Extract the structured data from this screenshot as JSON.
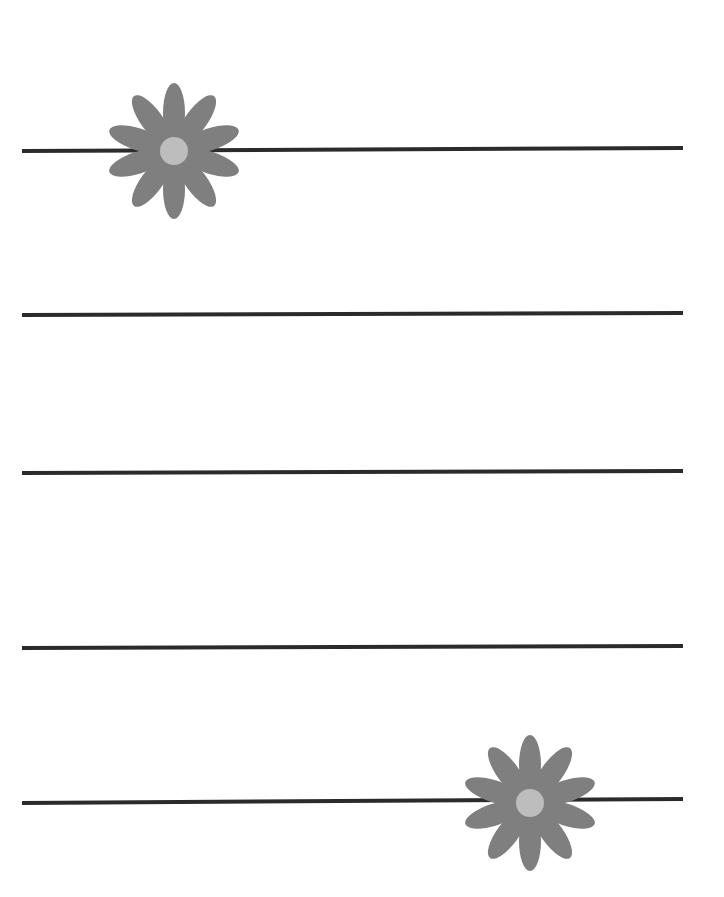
{
  "page": {
    "type": "lined stationery page",
    "background": "#ffffff",
    "line_color": "#2b2b2b",
    "line_count": 5
  },
  "lines": [
    {
      "x1": 22,
      "y1": 151,
      "x2": 683,
      "y2": 148
    },
    {
      "x1": 22,
      "y1": 315,
      "x2": 683,
      "y2": 313
    },
    {
      "x1": 22,
      "y1": 473,
      "x2": 683,
      "y2": 471
    },
    {
      "x1": 22,
      "y1": 648,
      "x2": 683,
      "y2": 646
    },
    {
      "x1": 22,
      "y1": 803,
      "x2": 683,
      "y2": 799
    }
  ],
  "decorations": [
    {
      "name": "flower-top-left",
      "cx": 174,
      "cy": 151,
      "petals": 10,
      "petal_color": "#7f7f7f",
      "center_color": "#bdbdbd"
    },
    {
      "name": "flower-bottom-right",
      "cx": 530,
      "cy": 803,
      "petals": 10,
      "petal_color": "#7f7f7f",
      "center_color": "#bdbdbd"
    }
  ]
}
